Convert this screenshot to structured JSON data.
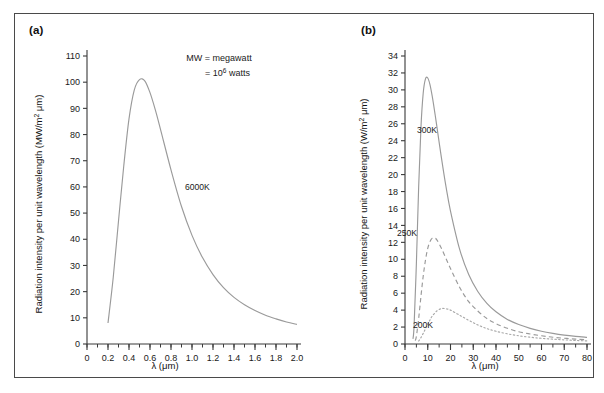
{
  "figure": {
    "background_color": "#ffffff",
    "frame_color": "#4a4a4a",
    "curve_color": "#9a9a9a"
  },
  "panel_a": {
    "label": "(a)",
    "note_line1": "MW = megawatt",
    "note_line2_prefix": "= 10",
    "note_line2_sup": "6",
    "note_line2_suffix": " watts",
    "curve_label": "6000K"
  },
  "panel_b": {
    "label": "(b)",
    "curve_label_300": "300K",
    "curve_label_250": "250K",
    "curve_label_200": "200K"
  },
  "chart_data": [
    {
      "type": "line",
      "panel": "(a)",
      "title": "",
      "xlabel": "λ (μm)",
      "ylabel": "Radiation intensity per unit wavelength (MW/m² μm)",
      "ylabel_parts": {
        "prefix": "Radiation intensity per unit wavelength (MW/m",
        "sup": "2",
        "suffix": " μm)"
      },
      "xlim": [
        0,
        2.0
      ],
      "ylim": [
        0,
        110
      ],
      "xticks": [
        0,
        0.2,
        0.4,
        0.6,
        0.8,
        1.0,
        1.2,
        1.4,
        1.6,
        1.8,
        2.0
      ],
      "xticklabels": [
        "0",
        "0.2",
        "0.4",
        "0.6",
        "0.8",
        "1.0",
        "1.2",
        "1.4",
        "1.6",
        "1.8",
        "2.0"
      ],
      "xminor_step": 0.1,
      "yticks": [
        0,
        10,
        20,
        30,
        40,
        50,
        60,
        70,
        80,
        90,
        100,
        110
      ],
      "yticklabels": [
        "0",
        "10",
        "20",
        "30",
        "40",
        "50",
        "60",
        "70",
        "80",
        "90",
        "100",
        "110"
      ],
      "grid": false,
      "legend": "inline-annotation",
      "annotations": [
        {
          "text": "MW = megawatt",
          "x": 1.3,
          "y": 104
        },
        {
          "text": "= 10^6 watts",
          "x": 1.45,
          "y": 96
        },
        {
          "text": "6000K",
          "x": 0.92,
          "y": 57
        }
      ],
      "series": [
        {
          "name": "6000K",
          "style": "solid",
          "color": "#9a9a9a",
          "x": [
            0.2,
            0.25,
            0.3,
            0.35,
            0.4,
            0.45,
            0.5,
            0.55,
            0.6,
            0.65,
            0.7,
            0.8,
            0.9,
            1.0,
            1.1,
            1.2,
            1.3,
            1.4,
            1.5,
            1.6,
            1.7,
            1.8,
            1.9,
            2.0
          ],
          "y": [
            8.0,
            25.5,
            47.0,
            68.0,
            86.0,
            97.0,
            101.0,
            100.5,
            96.0,
            89.5,
            82.0,
            66.5,
            52.5,
            41.5,
            33.0,
            26.5,
            21.5,
            17.8,
            15.0,
            12.8,
            11.0,
            9.6,
            8.4,
            7.5
          ]
        }
      ]
    },
    {
      "type": "line",
      "panel": "(b)",
      "title": "",
      "xlabel": "λ (μm)",
      "ylabel": "Radiation intensity per unit wavelength (W/m² μm)",
      "ylabel_parts": {
        "prefix": "Radiation intensity per unit wavelength (W/m",
        "sup": "2",
        "suffix": " μm)"
      },
      "xlim": [
        0,
        80
      ],
      "ylim": [
        0,
        34
      ],
      "xticks": [
        0,
        10,
        20,
        30,
        40,
        50,
        60,
        70,
        80
      ],
      "xticklabels": [
        "0",
        "10",
        "20",
        "30",
        "40",
        "50",
        "60",
        "70",
        "80"
      ],
      "xminor_step": 5,
      "yticks": [
        0,
        2,
        4,
        6,
        8,
        10,
        12,
        14,
        16,
        18,
        20,
        22,
        24,
        26,
        28,
        30,
        32,
        34
      ],
      "yticklabels": [
        "0",
        "2",
        "4",
        "6",
        "8",
        "10",
        "12",
        "14",
        "16",
        "18",
        "20",
        "22",
        "24",
        "26",
        "28",
        "30",
        "32",
        "34"
      ],
      "grid": false,
      "legend": "inline-annotation",
      "annotations": [
        {
          "text": "300K",
          "x": 19,
          "y": 24
        },
        {
          "text": "250K",
          "x": 13,
          "y": 13.6
        },
        {
          "text": "200K",
          "x": 19,
          "y": 2.4
        }
      ],
      "series": [
        {
          "name": "300K",
          "style": "solid",
          "color": "#9a9a9a",
          "peak_x": 10,
          "peak_y": 31.4,
          "x": [
            3.5,
            4,
            5,
            6,
            7,
            8,
            9,
            10,
            11,
            12,
            13,
            14,
            16,
            18,
            20,
            24,
            28,
            32,
            36,
            40,
            45,
            50,
            55,
            60,
            65,
            70,
            75,
            80
          ],
          "y": [
            0.6,
            2.2,
            9.5,
            18.5,
            25.5,
            29.6,
            31.3,
            31.4,
            30.6,
            29.2,
            27.5,
            25.7,
            22.0,
            18.6,
            15.7,
            11.2,
            8.2,
            6.2,
            4.8,
            3.8,
            2.9,
            2.3,
            1.85,
            1.5,
            1.25,
            1.05,
            0.9,
            0.78
          ]
        },
        {
          "name": "250K",
          "style": "dashed",
          "color": "#9a9a9a",
          "peak_x": 12,
          "peak_y": 12.5,
          "x": [
            4.5,
            5,
            6,
            7,
            8,
            9,
            10,
            11,
            12,
            13,
            14,
            16,
            18,
            20,
            24,
            28,
            32,
            36,
            40,
            45,
            50,
            55,
            60,
            65,
            70,
            75,
            80
          ],
          "y": [
            0.4,
            0.9,
            3.0,
            5.6,
            8.0,
            9.9,
            11.3,
            12.1,
            12.5,
            12.5,
            12.3,
            11.3,
            10.1,
            8.9,
            6.7,
            5.0,
            3.9,
            3.0,
            2.4,
            1.85,
            1.45,
            1.18,
            0.97,
            0.8,
            0.68,
            0.58,
            0.5
          ]
        },
        {
          "name": "200K",
          "style": "dotted",
          "color": "#a8a8a8",
          "peak_x": 16,
          "peak_y": 4.2,
          "x": [
            6,
            7,
            8,
            9,
            10,
            11,
            12,
            14,
            16,
            18,
            20,
            24,
            28,
            32,
            36,
            40,
            45,
            50,
            55,
            60,
            65,
            70,
            75,
            80
          ],
          "y": [
            0.35,
            0.75,
            1.25,
            1.8,
            2.35,
            2.85,
            3.3,
            3.9,
            4.18,
            4.15,
            4.0,
            3.4,
            2.8,
            2.25,
            1.82,
            1.5,
            1.2,
            0.97,
            0.8,
            0.67,
            0.57,
            0.49,
            0.42,
            0.37
          ]
        }
      ]
    }
  ]
}
